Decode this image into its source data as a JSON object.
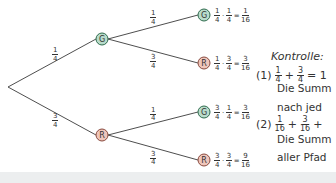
{
  "colors": {
    "green_fill": "#b9dccb",
    "green_stroke": "#2e6b4d",
    "red_fill": "#efc6bb",
    "red_stroke": "#8a4a3e",
    "line": "#3a3a3a",
    "band": "#eceeef"
  },
  "tree": {
    "root": {
      "x": 8,
      "y": 87
    },
    "level1": [
      {
        "label": "G",
        "color": "green",
        "x": 102,
        "y": 39,
        "edge_prob": {
          "num": "1",
          "den": "4"
        }
      },
      {
        "label": "R",
        "color": "red",
        "x": 102,
        "y": 135,
        "edge_prob": {
          "num": "3",
          "den": "4"
        }
      }
    ],
    "leaves": [
      {
        "label": "G",
        "color": "green",
        "x": 204,
        "y": 15,
        "parent": 0,
        "edge_prob": {
          "num": "1",
          "den": "4"
        },
        "product": {
          "a": {
            "num": "1",
            "den": "4"
          },
          "b": {
            "num": "1",
            "den": "4"
          },
          "result": {
            "num": "1",
            "den": "16"
          }
        }
      },
      {
        "label": "R",
        "color": "red",
        "x": 204,
        "y": 63,
        "parent": 0,
        "edge_prob": {
          "num": "3",
          "den": "4"
        },
        "product": {
          "a": {
            "num": "1",
            "den": "4"
          },
          "b": {
            "num": "3",
            "den": "4"
          },
          "result": {
            "num": "3",
            "den": "16"
          }
        }
      },
      {
        "label": "G",
        "color": "green",
        "x": 204,
        "y": 112,
        "parent": 1,
        "edge_prob": {
          "num": "1",
          "den": "4"
        },
        "product": {
          "a": {
            "num": "3",
            "den": "4"
          },
          "b": {
            "num": "1",
            "den": "4"
          },
          "result": {
            "num": "3",
            "den": "16"
          }
        }
      },
      {
        "label": "R",
        "color": "red",
        "x": 204,
        "y": 160,
        "parent": 1,
        "edge_prob": {
          "num": "3",
          "den": "4"
        },
        "product": {
          "a": {
            "num": "3",
            "den": "4"
          },
          "b": {
            "num": "3",
            "den": "4"
          },
          "result": {
            "num": "9",
            "den": "16"
          }
        }
      }
    ]
  },
  "kontrolle": {
    "title": "Kontrolle:",
    "item1": {
      "label": "(1)",
      "a": {
        "num": "1",
        "den": "4"
      },
      "plus": "+",
      "b": {
        "num": "3",
        "den": "4"
      },
      "eq": "= 1",
      "text1": "Die Summ",
      "text2": "nach jed"
    },
    "item2": {
      "label": "(2)",
      "a": {
        "num": "1",
        "den": "16"
      },
      "plus1": "+",
      "b": {
        "num": "3",
        "den": "16"
      },
      "plus2": "+",
      "text1": "Die Summ",
      "text2": "aller Pfad"
    }
  },
  "symbols": {
    "times": "·",
    "equals": "="
  }
}
